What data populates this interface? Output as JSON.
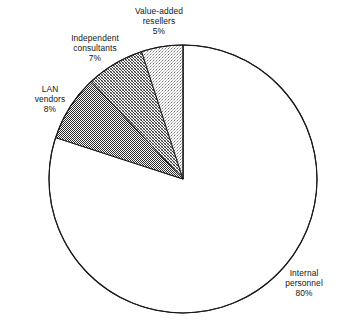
{
  "chart_data": {
    "type": "pie",
    "title": "",
    "subtitle": "",
    "xlabel": "",
    "ylabel": "",
    "legend_position": "none",
    "grid": false,
    "start_angle_deg": 90,
    "direction": "counterclockwise",
    "categories": [
      "Value-added resellers",
      "Independent consultants",
      "LAN vendors",
      "Internal personnel"
    ],
    "values": [
      5,
      7,
      8,
      80
    ],
    "unit": "%",
    "slices": [
      {
        "name": "Value-added resellers",
        "label_line1": "Value-added",
        "label_line2": "resellers",
        "value": 5,
        "value_label": "5%",
        "fill": "light-dither",
        "fill_color": "#d2d2d2",
        "stroke_color": "#1a1a1a"
      },
      {
        "name": "Independent consultants",
        "label_line1": "Independent",
        "label_line2": "consultants",
        "value": 7,
        "value_label": "7%",
        "fill": "medium-dither",
        "fill_color": "#ababab",
        "stroke_color": "#1a1a1a"
      },
      {
        "name": "LAN vendors",
        "label_line1": "LAN",
        "label_line2": "vendors",
        "value": 8,
        "value_label": "8%",
        "fill": "dark-dither",
        "fill_color": "#6b6b6b",
        "stroke_color": "#1a1a1a"
      },
      {
        "name": "Internal personnel",
        "label_line1": "Internal",
        "label_line2": "personnel",
        "value": 80,
        "value_label": "80%",
        "fill": "none",
        "fill_color": "#ffffff",
        "stroke_color": "#1a1a1a"
      }
    ]
  },
  "geometry": {
    "center_x": 183,
    "center_y": 179,
    "radius": 134
  }
}
